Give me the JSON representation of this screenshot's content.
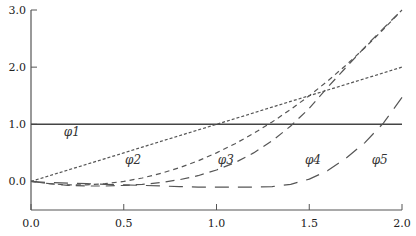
{
  "chart_data": {
    "type": "line",
    "title": "",
    "xlabel": "",
    "ylabel": "",
    "xlim": [
      0.0,
      2.0
    ],
    "ylim": [
      -0.5,
      3.0
    ],
    "grid": false,
    "x_ticks": [
      "0.0",
      "0.5",
      "1.0",
      "1.5",
      "2.0"
    ],
    "x_tick_values": [
      0.0,
      0.5,
      1.0,
      1.5,
      2.0
    ],
    "y_ticks": [
      "0.0",
      "1.0",
      "2.0",
      "3.0"
    ],
    "y_tick_values": [
      0.0,
      1.0,
      2.0,
      3.0
    ],
    "x": [
      0.0,
      0.1,
      0.2,
      0.3,
      0.4,
      0.5,
      0.6,
      0.7,
      0.8,
      0.9,
      1.0,
      1.1,
      1.2,
      1.3,
      1.4,
      1.5,
      1.6,
      1.7,
      1.8,
      1.9,
      2.0
    ],
    "series": [
      {
        "name": "φ1",
        "label_pos": [
          0.22,
          0.8
        ],
        "style": "solid",
        "values": [
          1,
          1,
          1,
          1,
          1,
          1,
          1,
          1,
          1,
          1,
          1,
          1,
          1,
          1,
          1,
          1,
          1,
          1,
          1,
          1,
          1
        ]
      },
      {
        "name": "φ2",
        "label_pos": [
          0.55,
          0.3
        ],
        "style": "dotted",
        "values": [
          0.0,
          0.1,
          0.2,
          0.3,
          0.4,
          0.5,
          0.6,
          0.7,
          0.8,
          0.9,
          1.0,
          1.1,
          1.2,
          1.3,
          1.4,
          1.5,
          1.6,
          1.7,
          1.8,
          1.9,
          2.0
        ]
      },
      {
        "name": "φ3",
        "label_pos": [
          1.05,
          0.3
        ],
        "style": "short-dash",
        "values": [
          0.0,
          -0.04,
          -0.06,
          -0.06,
          -0.04,
          0.0,
          0.06,
          0.14,
          0.24,
          0.36,
          0.5,
          0.66,
          0.84,
          1.04,
          1.26,
          1.5,
          1.76,
          2.04,
          2.34,
          2.66,
          3.0
        ]
      },
      {
        "name": "φ4",
        "label_pos": [
          1.52,
          0.3
        ],
        "style": "medium-dash",
        "values": [
          0.0,
          -0.04,
          -0.07,
          -0.08,
          -0.08,
          -0.07,
          -0.05,
          -0.02,
          0.03,
          0.1,
          0.2,
          0.33,
          0.5,
          0.71,
          0.97,
          1.28,
          1.65,
          2.0,
          2.35,
          2.68,
          3.0
        ]
      },
      {
        "name": "φ5",
        "label_pos": [
          1.88,
          0.3
        ],
        "style": "long-dash",
        "values": [
          0.0,
          -0.02,
          -0.03,
          -0.04,
          -0.05,
          -0.06,
          -0.07,
          -0.08,
          -0.09,
          -0.1,
          -0.1,
          -0.1,
          -0.1,
          -0.09,
          -0.05,
          0.04,
          0.19,
          0.41,
          0.68,
          1.02,
          1.47
        ]
      }
    ]
  }
}
